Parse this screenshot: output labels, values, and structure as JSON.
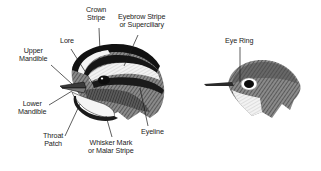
{
  "diagram": {
    "left_figure": {
      "subject": "bird-head-with-stripes",
      "labels": {
        "crown_stripe": [
          "Crown",
          "Stripe"
        ],
        "eyebrow_stripe": [
          "Eyebrow Stripe",
          "or Superciliary"
        ],
        "lore": [
          "Lore"
        ],
        "upper_mandible": [
          "Upper",
          "Mandible"
        ],
        "lower_mandible": [
          "Lower",
          "Mandible"
        ],
        "throat_patch": [
          "Throat",
          "Patch"
        ],
        "whisker_mark": [
          "Whisker Mark",
          "or Malar Stripe"
        ],
        "eyeline": [
          "Eyeline"
        ]
      }
    },
    "right_figure": {
      "subject": "bird-head-with-eye-ring",
      "labels": {
        "eye_ring": [
          "Eye Ring"
        ]
      }
    },
    "colors": {
      "ink": "#1a1a1a",
      "feather_gray": "#6e6e6e",
      "light_stripe": "#e8e8e8",
      "background": "#ffffff"
    }
  }
}
